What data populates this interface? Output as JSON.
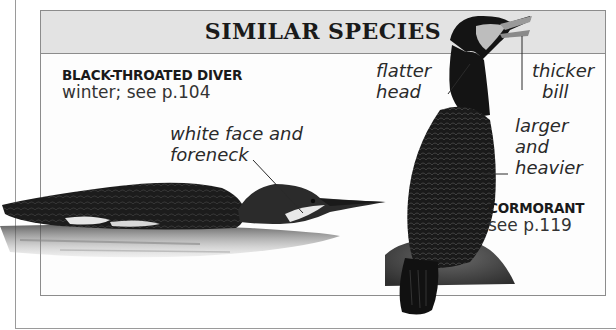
{
  "panel": {
    "title": "SIMILAR SPECIES"
  },
  "species": [
    {
      "name": "BLACK-THROATED DIVER",
      "reference": "winter; see p.104",
      "annotations": [
        {
          "text_line1": "white face and",
          "text_line2": "foreneck"
        }
      ]
    },
    {
      "name": "CORMORANT",
      "reference": "see p.119",
      "annotations": [
        {
          "text_line1": "flatter",
          "text_line2": "head"
        },
        {
          "text_line1": "thicker",
          "text_line2": "bill"
        },
        {
          "text_line1": "larger",
          "text_line2": "and",
          "text_line3": "heavier"
        }
      ]
    }
  ],
  "colors": {
    "header_bg": "#e3e3e3",
    "border": "#8c8c8c",
    "bird_dark": "#151515"
  }
}
